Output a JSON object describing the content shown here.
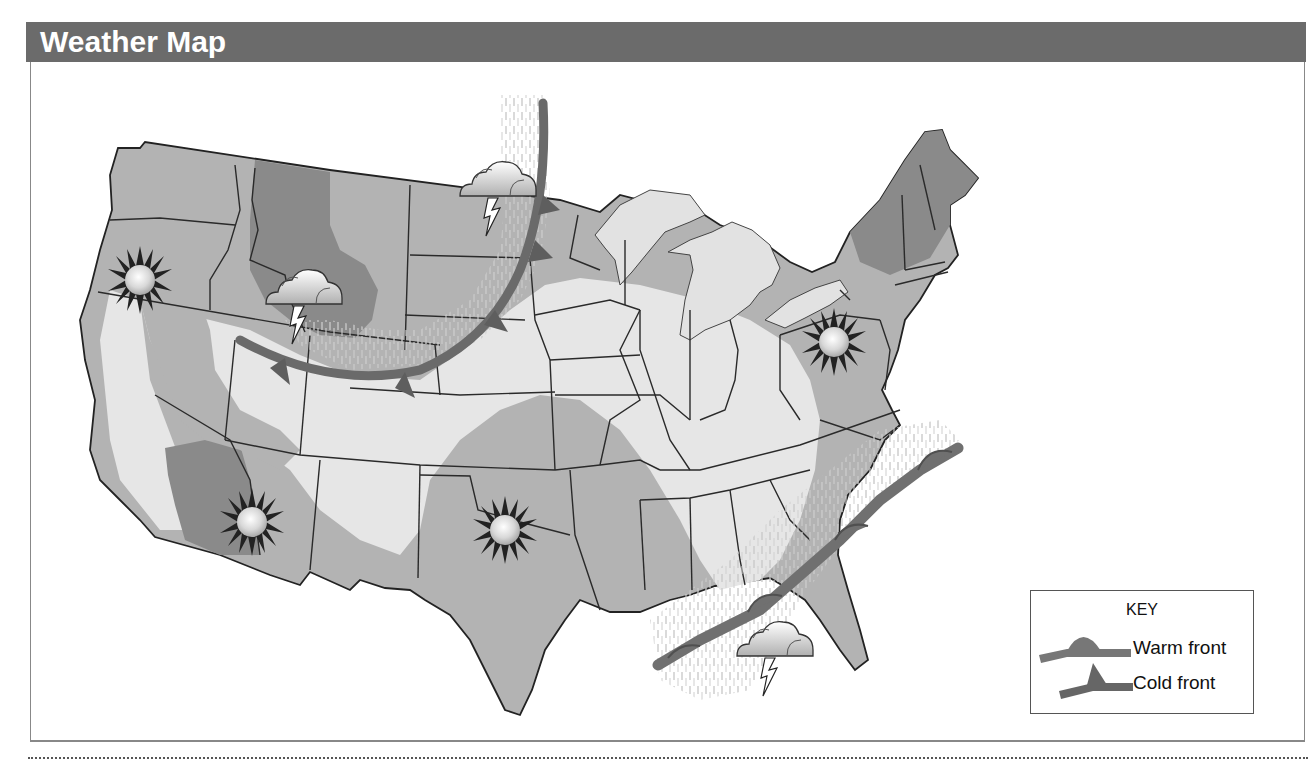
{
  "header": {
    "title": "Weather Map"
  },
  "key": {
    "title": "KEY",
    "items": [
      {
        "label": "Warm front",
        "symbol": "warm-front-icon"
      },
      {
        "label": "Cold front",
        "symbol": "cold-front-icon"
      }
    ]
  },
  "map": {
    "region": "Continental United States",
    "symbols": [
      {
        "type": "sunny-icon",
        "location": "Northern California / Oregon"
      },
      {
        "type": "thunderstorm-icon",
        "location": "North Dakota"
      },
      {
        "type": "thunderstorm-icon",
        "location": "Idaho / Wyoming"
      },
      {
        "type": "sunny-icon",
        "location": "Arizona"
      },
      {
        "type": "sunny-icon",
        "location": "Oklahoma / Texas"
      },
      {
        "type": "sunny-icon",
        "location": "Pennsylvania / West Virginia"
      },
      {
        "type": "thunderstorm-icon",
        "location": "Gulf of Mexico / Florida"
      }
    ],
    "fronts": [
      {
        "type": "cold front",
        "location": "Curving from Minnesota/North Dakota border through South Dakota, Nebraska to Idaho"
      },
      {
        "type": "warm front",
        "location": "Gulf Coast from Louisiana to the Carolinas coast"
      }
    ]
  },
  "colors": {
    "title_bar": "#6b6b6b",
    "land_light": "#e6e6e6",
    "land_mid": "#b3b3b3",
    "land_dark": "#8a8a8a",
    "front": "#707070",
    "border_lines": "#2a2a2a"
  }
}
